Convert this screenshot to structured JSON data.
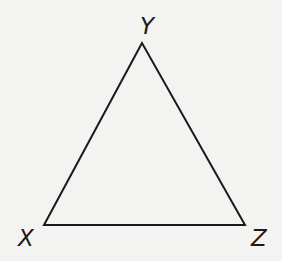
{
  "diagram": {
    "type": "triangle",
    "vertices": [
      {
        "name": "Y",
        "label": "Y",
        "x": 142,
        "y": 43,
        "label_x": 140,
        "label_y": 34
      },
      {
        "name": "X",
        "label": "X",
        "x": 44,
        "y": 225,
        "label_x": 18,
        "label_y": 246
      },
      {
        "name": "Z",
        "label": "Z",
        "x": 245,
        "y": 225,
        "label_x": 251,
        "label_y": 246
      }
    ],
    "edges": [
      [
        "X",
        "Y"
      ],
      [
        "Y",
        "Z"
      ],
      [
        "Z",
        "X"
      ]
    ],
    "colors": {
      "stroke": "#1a1a1a",
      "background": "#f3f3f1"
    }
  }
}
